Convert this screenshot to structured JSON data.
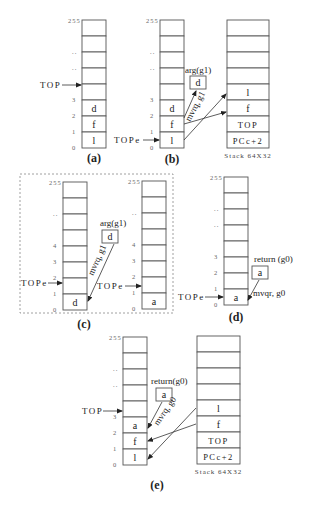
{
  "panels": [
    {
      "id": "a",
      "caption": "(a)",
      "stacks": [
        {
          "name": "register-stack",
          "x": 82,
          "y": 20,
          "w": 24,
          "rowH": 16,
          "index_labels": [
            "255",
            "..",
            "..",
            "",
            "3",
            "2",
            "1",
            "0"
          ],
          "cells": [
            "",
            "",
            "",
            "",
            "",
            "d",
            "f",
            "l"
          ]
        }
      ],
      "top_pointer": {
        "label": "TOP",
        "target_row": 4
      }
    },
    {
      "id": "b",
      "caption": "(b)",
      "stacks": [
        {
          "name": "register-stack",
          "x": 160,
          "y": 20,
          "w": 24,
          "rowH": 16,
          "index_labels": [
            "255",
            "..",
            "..",
            "",
            "3",
            "2",
            "1",
            "0"
          ],
          "cells": [
            "",
            "",
            "",
            "",
            "",
            "d",
            "f",
            "l"
          ]
        },
        {
          "name": "memory-stack",
          "x": 227,
          "y": 20,
          "w": 42,
          "rowH": 16,
          "index_labels": [],
          "cells": [
            "",
            "",
            "",
            "",
            "l",
            "f",
            "TOP",
            "PCc+2"
          ],
          "caption": "Stack 64X32"
        }
      ],
      "top_pointer": {
        "label": "TOPe",
        "target_row": 7
      },
      "arg_box": {
        "title": "arg(g1)",
        "value": "d"
      },
      "arrow_label": "mvrq, g1"
    },
    {
      "id": "c",
      "caption": "(c)",
      "stacks": [
        {
          "name": "register-stack-before",
          "x": 63,
          "y": 182,
          "w": 24,
          "rowH": 16,
          "index_labels": [
            "255",
            "..",
            "",
            "4",
            "3",
            "2",
            "1",
            "0"
          ],
          "cells": [
            "",
            "",
            "",
            "",
            "",
            "",
            "",
            "d"
          ]
        },
        {
          "name": "register-stack-after",
          "x": 142,
          "y": 181,
          "w": 24,
          "rowH": 16,
          "index_labels": [
            "255",
            "..",
            "",
            "4",
            "3",
            "2",
            "1",
            "0"
          ],
          "cells": [
            "",
            "",
            "",
            "",
            "",
            "",
            "",
            "a"
          ]
        }
      ],
      "top_pointers": [
        {
          "label": "TOPe",
          "stack": 0,
          "target_row": 6
        },
        {
          "label": "TOPe",
          "stack": 1,
          "target_row": 6
        }
      ],
      "arg_box": {
        "title": "arg(g1)",
        "value": "d"
      },
      "arrow_label": "mvrq, g1"
    },
    {
      "id": "d",
      "caption": "(d)",
      "stacks": [
        {
          "name": "register-stack",
          "x": 224,
          "y": 177,
          "w": 24,
          "rowH": 16,
          "index_labels": [
            "255",
            "..",
            "..",
            "",
            "3",
            "2",
            "1",
            "0"
          ],
          "cells": [
            "",
            "",
            "",
            "",
            "",
            "",
            "",
            "a"
          ]
        }
      ],
      "top_pointer": {
        "label": "TOPe",
        "target_row": 7
      },
      "return_box": {
        "title": "return (g0)",
        "value": "a"
      },
      "arrow_label": "mvqr, g0"
    },
    {
      "id": "e",
      "caption": "(e)",
      "stacks": [
        {
          "name": "register-stack",
          "x": 123,
          "y": 337,
          "w": 24,
          "rowH": 16,
          "index_labels": [
            "255",
            "..",
            "..",
            "",
            "3",
            "2",
            "1",
            "0"
          ],
          "cells": [
            "",
            "",
            "",
            "",
            "",
            "a",
            "f",
            "l"
          ]
        },
        {
          "name": "memory-stack",
          "x": 197,
          "y": 336,
          "w": 43,
          "rowH": 16,
          "index_labels": [],
          "cells": [
            "",
            "",
            "",
            "",
            "l",
            "f",
            "TOP",
            "PCc+2"
          ],
          "caption": "Stack 64X32"
        }
      ],
      "top_pointer": {
        "label": "TOP",
        "target_row": 4
      },
      "return_box": {
        "title": "return(g0)",
        "value": "a"
      },
      "arrow_label": "mvrq, g0"
    }
  ]
}
